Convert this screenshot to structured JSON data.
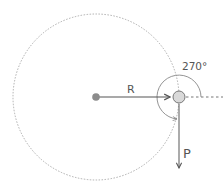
{
  "diagram": {
    "labels": {
      "radius": "R",
      "momentum": "P",
      "angle": "270°"
    },
    "colors": {
      "orbit": "#9a9a9a",
      "arrow": "#555555",
      "center_dot": "#8c8c8c",
      "body_fill": "#d9d9d9",
      "body_stroke": "#777777",
      "angle_arc": "#888888"
    }
  }
}
